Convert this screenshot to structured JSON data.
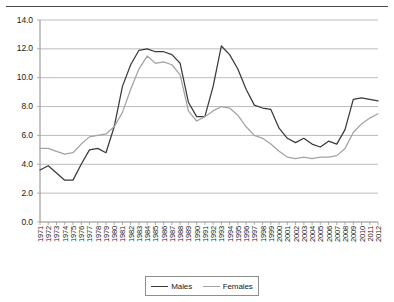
{
  "chart_data": {
    "type": "line",
    "title": "",
    "subtitle": "",
    "xlabel": "",
    "ylabel": "",
    "ylim": [
      0.0,
      14.0
    ],
    "ytick_labels": [
      "0.0",
      "2.0",
      "4.0",
      "6.0",
      "8.0",
      "10.0",
      "12.0",
      "14.0"
    ],
    "ytick_values": [
      0.0,
      2.0,
      4.0,
      6.0,
      8.0,
      10.0,
      12.0,
      14.0
    ],
    "grid": "horizontal",
    "legend_position": "bottom-center",
    "x": [
      1971,
      1972,
      1973,
      1974,
      1975,
      1976,
      1977,
      1978,
      1979,
      1980,
      1981,
      1982,
      1983,
      1984,
      1985,
      1986,
      1987,
      1988,
      1989,
      1990,
      1991,
      1992,
      1993,
      1994,
      1995,
      1996,
      1997,
      1998,
      1999,
      2000,
      2001,
      2002,
      2003,
      2004,
      2005,
      2006,
      2007,
      2008,
      2009,
      2010,
      2011,
      2012
    ],
    "categories": [
      "1971",
      "1972",
      "1973",
      "1974",
      "1975",
      "1976",
      "1977",
      "1978",
      "1979",
      "1980",
      "1981",
      "1982",
      "1983",
      "1984",
      "1985",
      "1986",
      "1987",
      "1988",
      "1989",
      "1990",
      "1991",
      "1992",
      "1993",
      "1994",
      "1995",
      "1996",
      "1997",
      "1998",
      "1999",
      "2000",
      "2001",
      "2002",
      "2003",
      "2004",
      "2005",
      "2006",
      "2007",
      "2008",
      "2009",
      "2010",
      "2011",
      "2012"
    ],
    "series": [
      {
        "name": "Males",
        "color": "#3a3a3a",
        "values": [
          3.6,
          3.9,
          3.4,
          2.9,
          2.9,
          4.0,
          5.0,
          5.1,
          4.8,
          6.6,
          9.4,
          10.9,
          11.9,
          12.0,
          11.8,
          11.8,
          11.6,
          11.0,
          8.3,
          7.3,
          7.3,
          9.4,
          12.2,
          11.6,
          10.6,
          9.2,
          8.1,
          7.9,
          7.8,
          6.5,
          5.8,
          5.5,
          5.8,
          5.4,
          5.2,
          5.6,
          5.4,
          6.4,
          8.5,
          8.6,
          8.5,
          8.4
        ]
      },
      {
        "name": "Females",
        "color": "#a3a3a3",
        "values": [
          5.1,
          5.1,
          4.9,
          4.7,
          4.8,
          5.4,
          5.9,
          6.0,
          6.1,
          6.6,
          7.6,
          9.2,
          10.6,
          11.5,
          11.0,
          11.1,
          10.9,
          10.2,
          7.7,
          7.0,
          7.3,
          7.7,
          8.0,
          7.9,
          7.4,
          6.6,
          6.0,
          5.8,
          5.4,
          4.9,
          4.5,
          4.4,
          4.5,
          4.4,
          4.5,
          4.5,
          4.6,
          5.1,
          6.2,
          6.8,
          7.2,
          7.5
        ]
      }
    ]
  },
  "legend": {
    "entries": [
      {
        "label": "Males",
        "color": "#3a3a3a"
      },
      {
        "label": "Females",
        "color": "#a3a3a3"
      }
    ]
  }
}
